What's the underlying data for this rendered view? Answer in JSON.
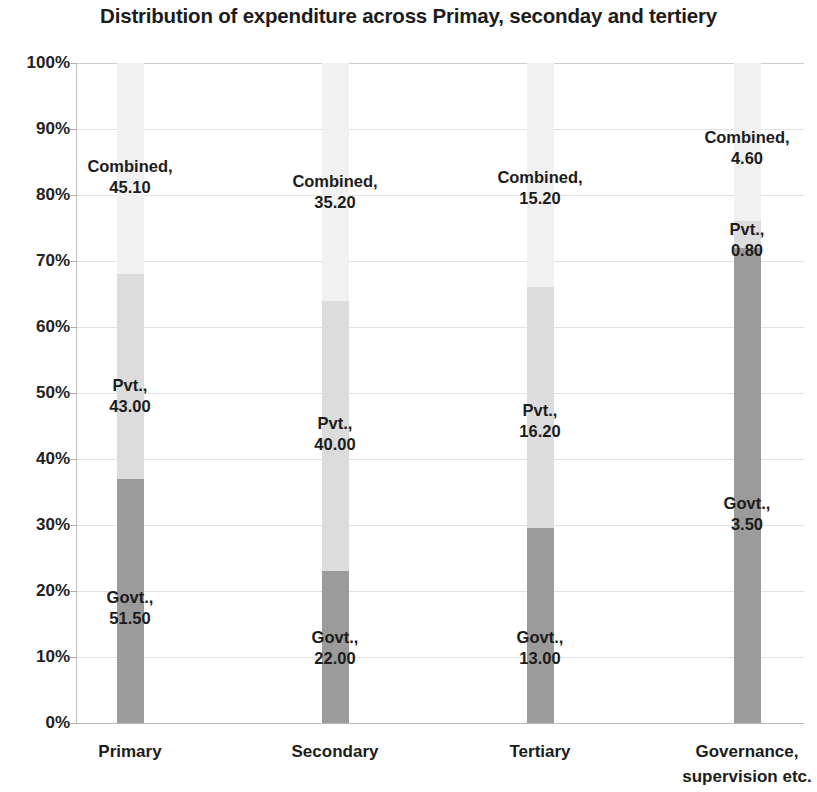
{
  "chart_data": {
    "type": "bar",
    "subtype": "100% stacked column",
    "title": "Distribution of expenditure across Primay, seconday and tertiery",
    "xlabel": "",
    "ylabel": "",
    "ylim": [
      0,
      100
    ],
    "ytick_labels": [
      "0%",
      "10%",
      "20%",
      "30%",
      "40%",
      "50%",
      "60%",
      "70%",
      "80%",
      "90%",
      "100%"
    ],
    "ytick_values": [
      0,
      10,
      20,
      30,
      40,
      50,
      60,
      70,
      80,
      90,
      100
    ],
    "grid": true,
    "legend": "none",
    "categories": [
      "Primary",
      "Secondary",
      "Tertiary",
      "Governance, supervision etc."
    ],
    "category_lines": [
      [
        "Primary"
      ],
      [
        "Secondary"
      ],
      [
        "Tertiary"
      ],
      [
        "Governance,",
        "supervision etc."
      ]
    ],
    "series": [
      {
        "name": "Govt.",
        "color": "#9b9b9b",
        "values": [
          51.5,
          22.0,
          13.0,
          3.5
        ],
        "value_labels": [
          "51.50",
          "22.00",
          "13.00",
          "3.50"
        ],
        "percent_of_column": [
          37.0,
          23.0,
          29.5,
          72.0
        ]
      },
      {
        "name": "Pvt.",
        "color": "#dcdcdc",
        "values": [
          43.0,
          40.0,
          16.2,
          0.8
        ],
        "value_labels": [
          "43.00",
          "40.00",
          "16.20",
          "0.80"
        ],
        "percent_of_column": [
          31.0,
          41.0,
          36.5,
          4.0
        ]
      },
      {
        "name": "Combined",
        "color": "#f1f1f1",
        "values": [
          45.1,
          35.2,
          15.2,
          4.6
        ],
        "value_labels": [
          "45.10",
          "35.20",
          "15.20",
          "4.60"
        ],
        "percent_of_column": [
          32.0,
          36.0,
          34.0,
          24.0
        ]
      }
    ],
    "point_labels": [
      {
        "series": "Combined",
        "category": "Primary",
        "name": "Combined,",
        "value": "45.10"
      },
      {
        "series": "Pvt.",
        "category": "Primary",
        "name": "Pvt.,",
        "value": "43.00"
      },
      {
        "series": "Govt.",
        "category": "Primary",
        "name": "Govt.,",
        "value": "51.50"
      },
      {
        "series": "Combined",
        "category": "Secondary",
        "name": "Combined,",
        "value": "35.20"
      },
      {
        "series": "Pvt.",
        "category": "Secondary",
        "name": "Pvt.,",
        "value": "40.00"
      },
      {
        "series": "Govt.",
        "category": "Secondary",
        "name": "Govt.,",
        "value": "22.00"
      },
      {
        "series": "Combined",
        "category": "Tertiary",
        "name": "Combined,",
        "value": "15.20"
      },
      {
        "series": "Pvt.",
        "category": "Tertiary",
        "name": "Pvt.,",
        "value": "16.20"
      },
      {
        "series": "Govt.",
        "category": "Tertiary",
        "name": "Govt.,",
        "value": "13.00"
      },
      {
        "series": "Combined",
        "category": "Governance, supervision etc.",
        "name": "Combined,",
        "value": "4.60"
      },
      {
        "series": "Pvt.",
        "category": "Governance, supervision etc.",
        "name": "Pvt.,",
        "value": "0.80"
      },
      {
        "series": "Govt.",
        "category": "Governance, supervision etc.",
        "name": "Govt.,",
        "value": "3.50"
      }
    ]
  },
  "layout": {
    "plot": {
      "left": 77,
      "top": 63,
      "width": 727,
      "height": 660
    },
    "bar_width": 27,
    "bar_centers": [
      130,
      335,
      540,
      747
    ],
    "columns": [
      {
        "category_index": 0,
        "segments": [
          {
            "series_index": 0,
            "bottom_pct": 0,
            "height_pct": 37.0
          },
          {
            "series_index": 1,
            "bottom_pct": 37.0,
            "height_pct": 31.0
          },
          {
            "series_index": 2,
            "bottom_pct": 68.0,
            "height_pct": 32.0
          }
        ],
        "labels": [
          {
            "point_index": 2,
            "x": 130,
            "y": 608
          },
          {
            "point_index": 1,
            "x": 130,
            "y": 396
          },
          {
            "point_index": 0,
            "x": 130,
            "y": 177
          }
        ]
      },
      {
        "category_index": 1,
        "segments": [
          {
            "series_index": 0,
            "bottom_pct": 0,
            "height_pct": 23.0
          },
          {
            "series_index": 1,
            "bottom_pct": 23.0,
            "height_pct": 41.0
          },
          {
            "series_index": 2,
            "bottom_pct": 64.0,
            "height_pct": 36.0
          }
        ],
        "labels": [
          {
            "point_index": 5,
            "x": 335,
            "y": 648
          },
          {
            "point_index": 4,
            "x": 335,
            "y": 434
          },
          {
            "point_index": 3,
            "x": 335,
            "y": 192
          }
        ]
      },
      {
        "category_index": 2,
        "segments": [
          {
            "series_index": 0,
            "bottom_pct": 0,
            "height_pct": 29.5
          },
          {
            "series_index": 1,
            "bottom_pct": 29.5,
            "height_pct": 36.5
          },
          {
            "series_index": 2,
            "bottom_pct": 66.0,
            "height_pct": 34.0
          }
        ],
        "labels": [
          {
            "point_index": 8,
            "x": 540,
            "y": 648
          },
          {
            "point_index": 7,
            "x": 540,
            "y": 421
          },
          {
            "point_index": 6,
            "x": 540,
            "y": 188
          }
        ]
      },
      {
        "category_index": 3,
        "segments": [
          {
            "series_index": 0,
            "bottom_pct": 0,
            "height_pct": 72.0
          },
          {
            "series_index": 1,
            "bottom_pct": 72.0,
            "height_pct": 4.0
          },
          {
            "series_index": 2,
            "bottom_pct": 76.0,
            "height_pct": 24.0
          }
        ],
        "labels": [
          {
            "point_index": 11,
            "x": 747,
            "y": 514
          },
          {
            "point_index": 10,
            "x": 747,
            "y": 240
          },
          {
            "point_index": 9,
            "x": 747,
            "y": 148
          }
        ]
      }
    ],
    "x_label_centers": [
      130,
      335,
      540,
      747
    ]
  }
}
